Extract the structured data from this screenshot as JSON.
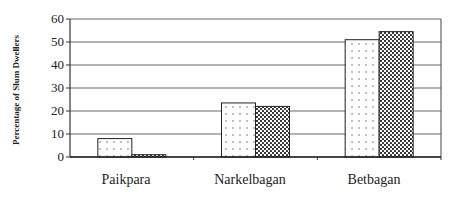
{
  "chart_data": {
    "type": "bar",
    "title": "",
    "xlabel": "",
    "ylabel": "Percentage of Slum Dwellers",
    "ylim": [
      0,
      60
    ],
    "yticks": [
      0,
      10,
      20,
      30,
      40,
      50,
      60
    ],
    "grid": true,
    "legend": "none shown",
    "categories": [
      "Paikpara",
      "Narkelbagan",
      "Betbagan"
    ],
    "series": [
      {
        "name": "Series 1 (light dotted)",
        "pattern": "sparse-dots",
        "values": [
          8,
          23.5,
          51
        ]
      },
      {
        "name": "Series 2 (dense dotted)",
        "pattern": "dense-dots",
        "values": [
          1,
          22,
          54.5
        ]
      }
    ]
  },
  "labels": {
    "ylabel": "Percentage of Slum Dwellers",
    "ticks": [
      "0",
      "10",
      "20",
      "30",
      "40",
      "50",
      "60"
    ],
    "categories": [
      "Paikpara",
      "Narkelbagan",
      "Betbagan"
    ]
  }
}
